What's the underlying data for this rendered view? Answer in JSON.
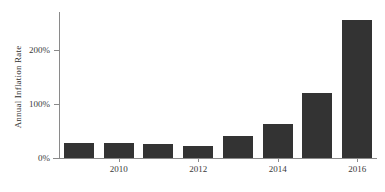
{
  "chart_data": {
    "type": "bar",
    "title": "",
    "xlabel": "",
    "ylabel": "Annual Inflation Rate",
    "categories": [
      "2009",
      "2010",
      "2011",
      "2012",
      "2013",
      "2014",
      "2015",
      "2016"
    ],
    "values": [
      27,
      28,
      26,
      23,
      41,
      62,
      120,
      255
    ],
    "ylim": [
      0,
      270
    ],
    "y_ticks": [
      0,
      100,
      200
    ],
    "y_tick_labels": [
      "0%",
      "100%",
      "200%"
    ],
    "x_ticks": [
      "2010",
      "2012",
      "2014",
      "2016"
    ],
    "x_tick_categories": [
      "2010",
      "2012",
      "2014",
      "2016"
    ],
    "grid": false,
    "legend": false,
    "bar_color": "#333333",
    "axis_color": "#8a8a8a",
    "text_color": "#3a3a3a"
  },
  "axes": {
    "y_title": "Annual Inflation Rate",
    "y_labels": [
      "200%",
      "100%",
      "0%"
    ],
    "x_labels": [
      "2010",
      "2012",
      "2014",
      "2016"
    ]
  }
}
